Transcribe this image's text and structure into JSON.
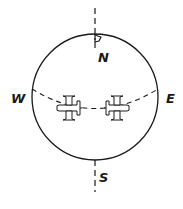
{
  "diagram": {
    "type": "globe-hemisphere-sketch",
    "colors": {
      "ink": "#1a1a1a",
      "background": "#ffffff"
    },
    "labels": {
      "north": "N",
      "south": "S",
      "west": "W",
      "east": "E"
    },
    "elements": {
      "globe": "circle",
      "axis": "dashed vertical polar axis",
      "equator": "dashed curved equator line",
      "flag": "flag at north pole",
      "planes": [
        {
          "name": "left-plane",
          "heading": "west"
        },
        {
          "name": "right-plane",
          "heading": "east"
        }
      ]
    }
  }
}
